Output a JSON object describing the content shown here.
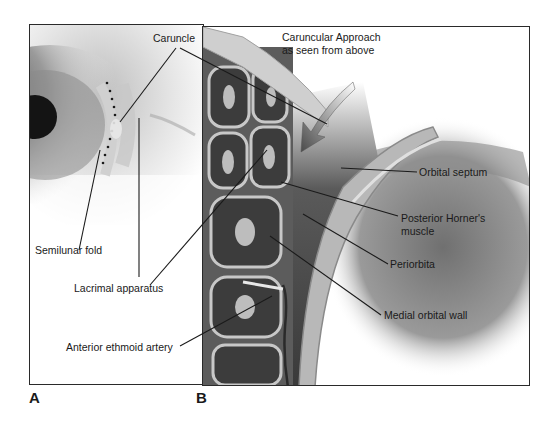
{
  "figure": {
    "title_line1": "Caruncular Approach",
    "title_line2": "as seen from above",
    "panels": [
      {
        "id": "A",
        "letter": "A",
        "description": "Clinical view of medial canthus of the eye"
      },
      {
        "id": "B",
        "letter": "B",
        "description": "Axial illustration of caruncular approach to medial orbit"
      }
    ],
    "labels": {
      "caruncle": "Caruncle",
      "semilunar_fold": "Semilunar fold",
      "lacrimal_apparatus": "Lacrimal apparatus",
      "anterior_ethmoid_artery": "Anterior ethmoid artery",
      "orbital_septum": "Orbital septum",
      "posterior_horners_muscle_line1": "Posterior Horner's",
      "posterior_horners_muscle_line2": "muscle",
      "periorbita": "Periorbita",
      "medial_orbital_wall": "Medial orbital wall"
    },
    "colors": {
      "line": "#1a1a1a",
      "frame": "#2a2a2a",
      "dark_tissue": "#3a3a3a",
      "mid_tissue": "#8a8a8a",
      "light_tissue": "#d8d8d8"
    }
  }
}
